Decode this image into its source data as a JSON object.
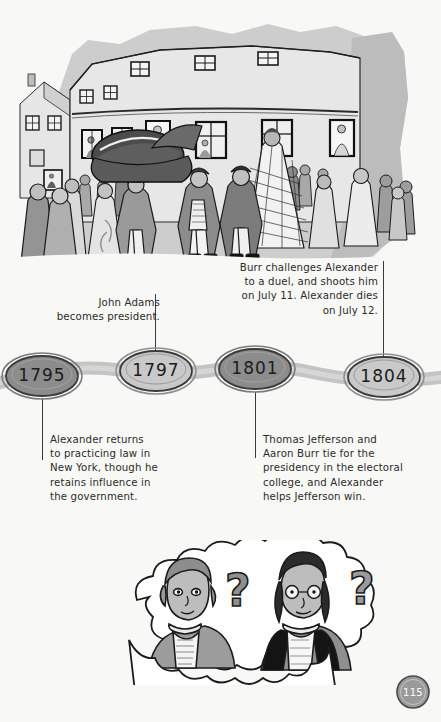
{
  "page": {
    "number": "115",
    "background_color": "#f8f8f6",
    "ink_color": "#2b2b2b"
  },
  "illustration_top": {
    "name": "street-crowd-scene",
    "description": "Crowd of people in 18th century dress gathered in a street in front of a tall building with many windows; a large dark carriage or hat-shape in the foreground.",
    "palette": {
      "building": "#c9c9c9",
      "shadow": "#b4b4b4",
      "figure_dark": "#6e6e6e",
      "figure_mid": "#9a9a9a",
      "outline": "#1b1b1b"
    }
  },
  "timeline": {
    "ribbon_color": "#c4c4c4",
    "nodes": [
      {
        "year": "1795",
        "fill": "#8c8c8c",
        "cx": 42,
        "cy": 376,
        "rx": 38,
        "ry": 22
      },
      {
        "year": "1797",
        "fill": "#c7c7c7",
        "cx": 156,
        "cy": 371,
        "rx": 38,
        "ry": 22
      },
      {
        "year": "1801",
        "fill": "#8c8c8c",
        "cx": 255,
        "cy": 369,
        "rx": 38,
        "ry": 22
      },
      {
        "year": "1804",
        "fill": "#c7c7c7",
        "cx": 384,
        "cy": 377,
        "rx": 38,
        "ry": 22
      }
    ],
    "notes": [
      {
        "id": "note-1797",
        "year": "1797",
        "align": "right",
        "position": "above",
        "text": "John Adams\nbecomes president."
      },
      {
        "id": "note-1804",
        "year": "1804",
        "align": "right",
        "position": "above",
        "text": "Burr challenges Alexander\nto a duel, and shoots him\non July 11. Alexander dies\non July 12."
      },
      {
        "id": "note-1795",
        "year": "1795",
        "align": "left",
        "position": "below",
        "text": "Alexander returns\nto practicing law in\nNew York, though he\nretains influence in\nthe government."
      },
      {
        "id": "note-1801",
        "year": "1801",
        "align": "left",
        "position": "below",
        "text": "Thomas Jefferson and\nAaron Burr tie for the\npresidency in the electoral\ncollege, and Alexander\nhelps Jefferson win."
      }
    ]
  },
  "illustration_bottom": {
    "name": "thought-cloud-two-men",
    "description": "A large white thought cloud containing two men in period dress, each with a question mark beside his head.",
    "question_mark": "?",
    "palette": {
      "cloud": "#ffffff",
      "skin": "#b8b8b8",
      "coat_dark": "#1b1b1b",
      "coat_mid": "#8f8f8f",
      "outline": "#1b1b1b"
    }
  }
}
